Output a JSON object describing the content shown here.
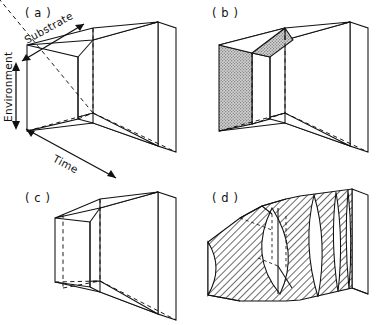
{
  "figure": {
    "type": "scientific-line-diagram",
    "background_color": "#ffffff",
    "line_color": "#111111",
    "shade_color": "#c9c9c9",
    "panels": [
      {
        "id": "a",
        "label": "( a )",
        "style": "wireframe-with-axes",
        "shading": "none"
      },
      {
        "id": "b",
        "label": "( b )",
        "style": "wireframe-with-stipple",
        "shading": "gray-stipple"
      },
      {
        "id": "c",
        "label": "( c )",
        "style": "wireframe-narrow-neck",
        "shading": "none"
      },
      {
        "id": "d",
        "label": "( d )",
        "style": "hatched-with-lens-voids",
        "shading": "diagonal-hatch"
      }
    ],
    "axes": [
      {
        "name": "substrate-axis",
        "label": "Substrate",
        "orientation": "diagonal-up-right",
        "arrow": "double-headed"
      },
      {
        "name": "environment-axis",
        "label": "Environment",
        "orientation": "vertical",
        "arrow": "double-headed"
      },
      {
        "name": "time-axis",
        "label": "Time",
        "orientation": "diagonal-down-right",
        "arrow": "double-headed"
      }
    ]
  }
}
